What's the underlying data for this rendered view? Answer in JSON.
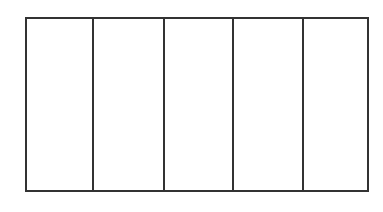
{
  "diagram": {
    "type": "rectangle divided into equal vertical strips",
    "columns": 5,
    "stroke_color": "#333333",
    "fill_color": "#ffffff",
    "cells": [
      {
        "label": "",
        "shaded": false
      },
      {
        "label": "",
        "shaded": false
      },
      {
        "label": "",
        "shaded": false
      },
      {
        "label": "",
        "shaded": false
      },
      {
        "label": "",
        "shaded": false
      }
    ]
  }
}
